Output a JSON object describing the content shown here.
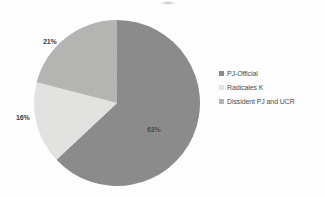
{
  "chart_data": {
    "type": "pie",
    "title": "",
    "subtitle": "",
    "xlabel": "",
    "ylabel": "",
    "grid": false,
    "legend_position": "right",
    "start_angle_deg": 0,
    "direction": "clockwise",
    "categories": [
      "PJ-Official",
      "Radicales K",
      "Dissident PJ and UCR"
    ],
    "values": [
      63,
      16,
      21
    ],
    "value_unit": "%",
    "data_labels": [
      "63%",
      "16%",
      "21%"
    ],
    "colors": [
      "#8a8a8a",
      "#e3e3e1",
      "#b4b4b2"
    ],
    "slices": [
      {
        "label": "PJ-Official",
        "value": 63,
        "data_label": "63%",
        "color": "#8a8a8a"
      },
      {
        "label": "Radicales K",
        "value": 16,
        "data_label": "16%",
        "color": "#e3e3e1"
      },
      {
        "label": "Dissident PJ and UCR",
        "value": 21,
        "data_label": "21%",
        "color": "#b4b4b2"
      }
    ]
  },
  "legend": {
    "items": [
      {
        "label": "PJ-Official",
        "color": "#8a8a8a"
      },
      {
        "label": "Radicales K",
        "color": "#e3e3e1"
      },
      {
        "label": "Dissident PJ and UCR",
        "color": "#b4b4b2"
      }
    ]
  },
  "colors": {
    "background": "#ffffff",
    "slice_primary": "#8a8a8a",
    "slice_secondary": "#e3e3e1",
    "slice_tertiary": "#b4b4b2",
    "label_text": "#3a3a3a",
    "legend_text": "#4a4a4a"
  }
}
